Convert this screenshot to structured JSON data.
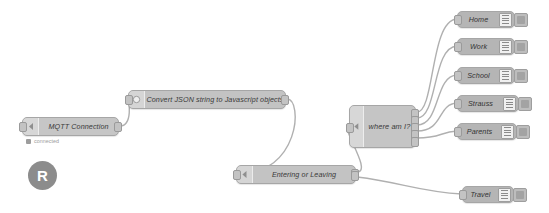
{
  "canvas": {
    "app": "Node-RED flow editor",
    "background": "#ffffff",
    "wire_color": "#b0b0b0",
    "node_fill": "#b9b9b9",
    "node_border": "#a6a6a6"
  },
  "watermark": {
    "letter": "R",
    "icon": "registered-mark-icon"
  },
  "nodes": {
    "mqtt": {
      "label": "MQTT Connection",
      "status": "connected",
      "status_icon": "status-square-icon",
      "type": "mqtt-in"
    },
    "convert": {
      "label": "Convert JSON string to Javascript objects",
      "type": "function"
    },
    "entering": {
      "label": "Entering or Leaving",
      "type": "function"
    },
    "where": {
      "label": "where am I?",
      "type": "switch",
      "outputs": 5
    }
  },
  "debug_nodes": [
    {
      "label": "Home",
      "icon": "debug-bars-icon",
      "button": "debug-toggle-button"
    },
    {
      "label": "Work",
      "icon": "debug-bars-icon",
      "button": "debug-toggle-button"
    },
    {
      "label": "School",
      "icon": "debug-bars-icon",
      "button": "debug-toggle-button"
    },
    {
      "label": "Strauss",
      "icon": "debug-bars-icon",
      "button": "debug-toggle-button"
    },
    {
      "label": "Parents",
      "icon": "debug-bars-icon",
      "button": "debug-toggle-button"
    },
    {
      "label": "Travel",
      "icon": "debug-bars-icon",
      "button": "debug-toggle-button"
    }
  ]
}
